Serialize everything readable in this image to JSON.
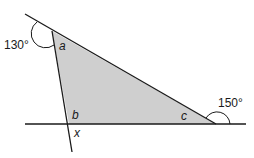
{
  "diagram": {
    "type": "geometry-triangle-angles",
    "colors": {
      "line": "#1a1a1a",
      "fill": "#cfcfcf",
      "background": "#ffffff"
    },
    "angles": {
      "exterior_top_left": "130°",
      "exterior_right": "150°"
    },
    "vertices": {
      "top": "a",
      "bottom_left": "b",
      "bottom_right": "c"
    },
    "unknown": "x"
  }
}
